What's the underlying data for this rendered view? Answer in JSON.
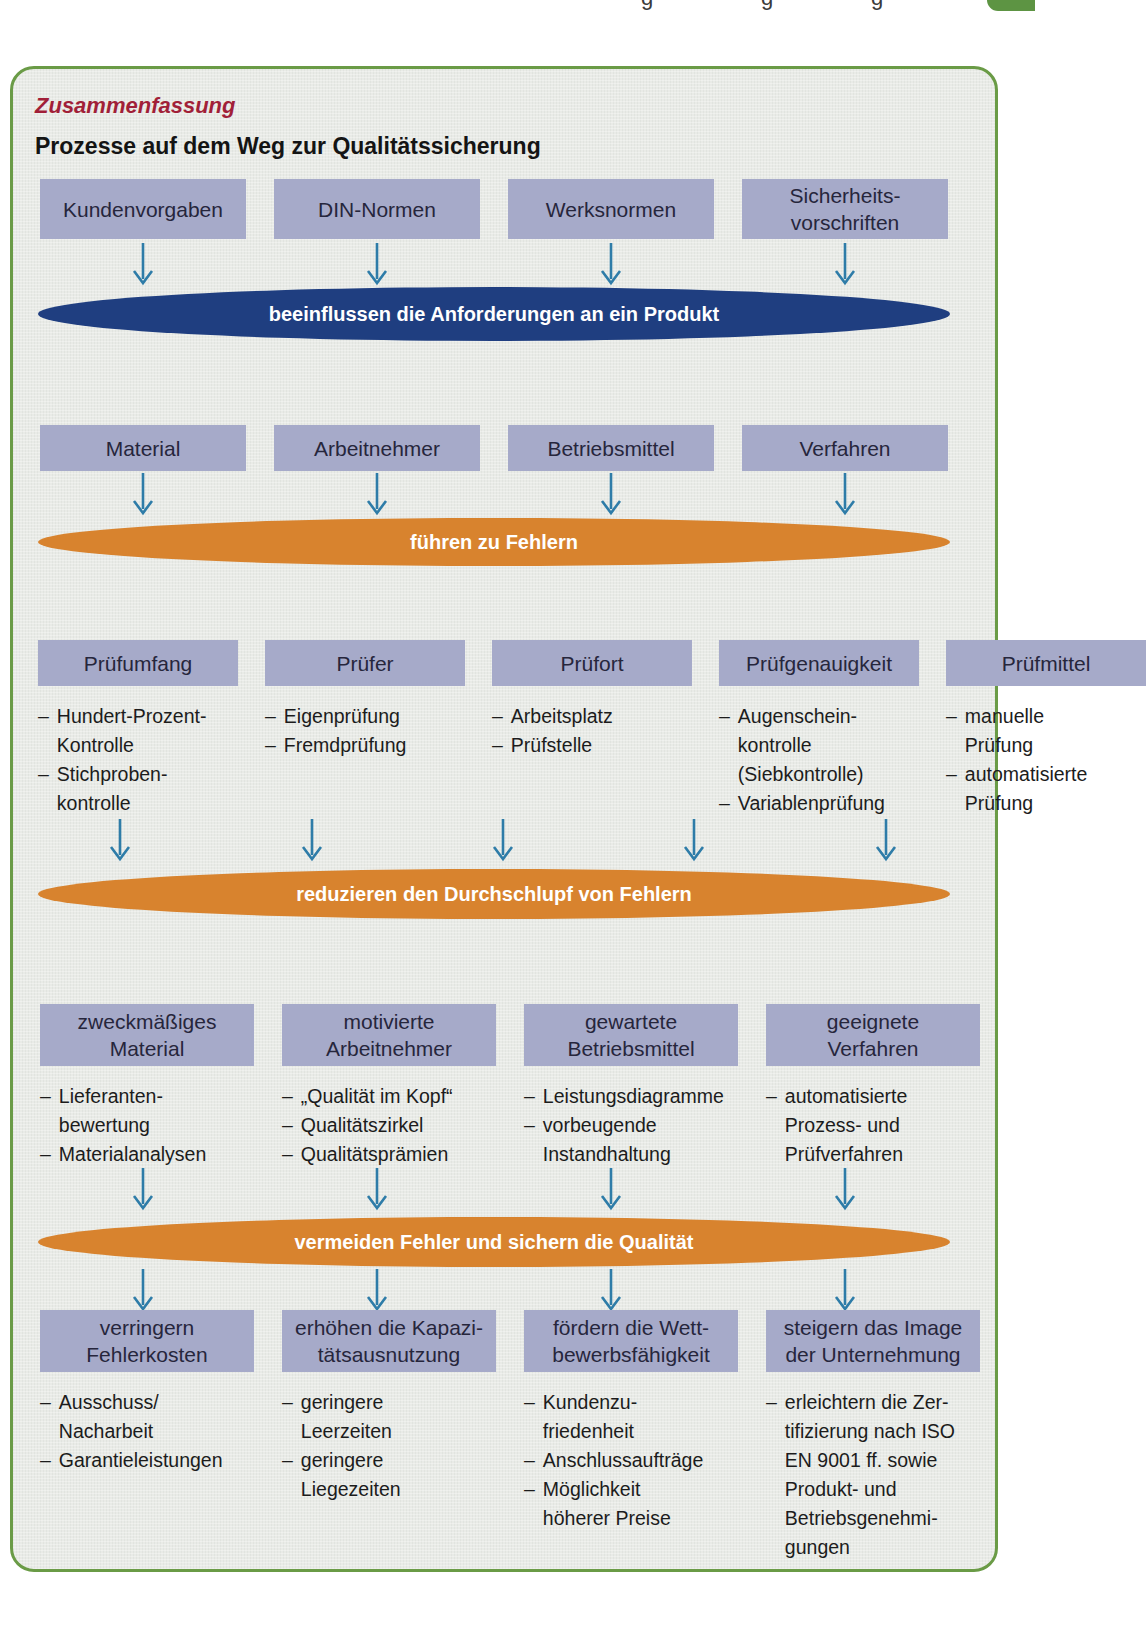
{
  "bullet_char": "–",
  "page_top": {
    "cropped_descenders": [
      "g",
      "g",
      "g"
    ]
  },
  "panel": {
    "label": "Zusammenfassung",
    "title": "Prozesse auf dem Weg zur Qualitätssicherung",
    "colors": {
      "panel_border_green": "#6a9b46",
      "panel_background": "#e9ebe7",
      "box_fill_lavender": "#a6aac9",
      "ellipse_navy": "#1f3e80",
      "ellipse_orange": "#d8832e",
      "arrow_blue": "#2e7ca8",
      "label_red": "#a11f38"
    },
    "rows": {
      "influences": {
        "boxes": [
          "Kundenvorgaben",
          "DIN-Normen",
          "Werksnormen",
          "Sicherheits-\nvorschriften"
        ],
        "ellipse": "beeinflussen die Anforderungen an ein Produkt"
      },
      "fault_sources": {
        "boxes": [
          "Material",
          "Arbeitnehmer",
          "Betriebsmittel",
          "Verfahren"
        ],
        "ellipse": "führen zu Fehlern"
      },
      "inspection": {
        "columns": [
          {
            "header": "Prüfumfang",
            "items": [
              "Hundert-Prozent-\nKontrolle",
              "Stichproben-\nkontrolle"
            ]
          },
          {
            "header": "Prüfer",
            "items": [
              "Eigenprüfung",
              "Fremdprüfung"
            ]
          },
          {
            "header": "Prüfort",
            "items": [
              "Arbeitsplatz",
              "Prüfstelle"
            ]
          },
          {
            "header": "Prüfgenauigkeit",
            "items": [
              "Augenschein-\nkontrolle\n(Siebkontrolle)",
              "Variablenprüfung"
            ]
          },
          {
            "header": "Prüfmittel",
            "items": [
              "manuelle\nPrüfung",
              "automatisierte\nPrüfung"
            ]
          }
        ],
        "ellipse": "reduzieren den Durchschlupf von Fehlern"
      },
      "prevention": {
        "columns": [
          {
            "header": "zweckmäßiges\nMaterial",
            "items": [
              "Lieferanten-\nbewertung",
              "Materialanalysen"
            ]
          },
          {
            "header": "motivierte\nArbeitnehmer",
            "items": [
              "„Qualität im Kopf“",
              "Qualitätszirkel",
              "Qualitätsprämien"
            ]
          },
          {
            "header": "gewartete\nBetriebsmittel",
            "items": [
              "Leistungsdiagramme",
              "vorbeugende\nInstandhaltung"
            ]
          },
          {
            "header": "geeignete\nVerfahren",
            "items": [
              "automatisierte\nProzess- und\nPrüfverfahren"
            ]
          }
        ],
        "ellipse": "vermeiden Fehler und sichern die Qualität"
      },
      "benefits": {
        "columns": [
          {
            "header": "verringern\nFehlerkosten",
            "items": [
              "Ausschuss/\nNacharbeit",
              "Garantieleistungen"
            ]
          },
          {
            "header": "erhöhen die Kapazi-\ntätsausnutzung",
            "items": [
              "geringere\nLeerzeiten",
              "geringere\nLiegezeiten"
            ]
          },
          {
            "header": "fördern die Wett-\nbewerbsfähigkeit",
            "items": [
              "Kundenzu-\nfriedenheit",
              "Anschlussaufträge",
              "Möglichkeit\nhöherer Preise"
            ]
          },
          {
            "header": "steigern das Image\nder Unternehmung",
            "items": [
              "erleichtern die Zer-\ntifizierung nach ISO\nEN 9001 ff. sowie\nProdukt- und\nBetriebsgenehmi-\ngungen"
            ]
          }
        ]
      }
    }
  }
}
